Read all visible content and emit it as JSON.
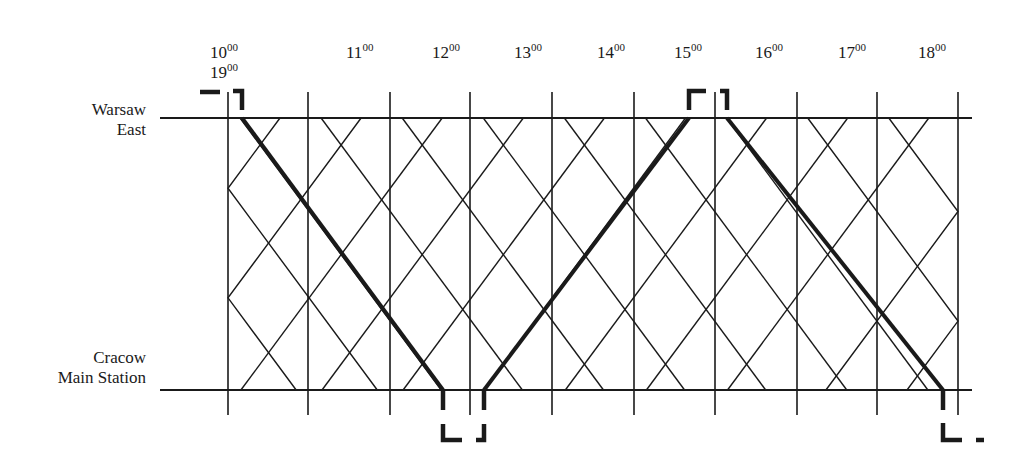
{
  "diagram": {
    "type": "train-graph",
    "stations": {
      "top": {
        "line1": "Warsaw",
        "line2": "East"
      },
      "bottom": {
        "line1": "Cracow",
        "line2": "Main Station"
      }
    },
    "time_labels": [
      {
        "hour": "10",
        "min": "00",
        "x": 210
      },
      {
        "hour": "19",
        "min": "00",
        "x": 210
      },
      {
        "hour": "11",
        "min": "00",
        "x": 346
      },
      {
        "hour": "12",
        "min": "00",
        "x": 432
      },
      {
        "hour": "13",
        "min": "00",
        "x": 514
      },
      {
        "hour": "14",
        "min": "00",
        "x": 597
      },
      {
        "hour": "15",
        "min": "00",
        "x": 674
      },
      {
        "hour": "16",
        "min": "00",
        "x": 755
      },
      {
        "hour": "17",
        "min": "00",
        "x": 838
      },
      {
        "hour": "18",
        "min": "00",
        "x": 918
      }
    ],
    "colors": {
      "line": "#1a1a1a",
      "background": "#ffffff"
    },
    "grid": {
      "top_y": 118,
      "bottom_y": 390,
      "left_x": 160,
      "right_x": 972,
      "verticals": [
        228,
        308,
        390,
        470,
        552,
        634,
        715,
        797,
        877,
        958
      ],
      "wall_left": 228,
      "wall_right": 958
    },
    "highlighted_runs": [
      {
        "from": "Warsaw East",
        "to": "Cracow Main Station",
        "x_start": 242,
        "x_end": 443
      },
      {
        "from": "Cracow Main Station",
        "to": "Warsaw East",
        "x_start": 484,
        "x_end": 689
      },
      {
        "from": "Warsaw East",
        "to": "Cracow Main Station",
        "x_start": 727,
        "x_end": 943
      }
    ]
  }
}
